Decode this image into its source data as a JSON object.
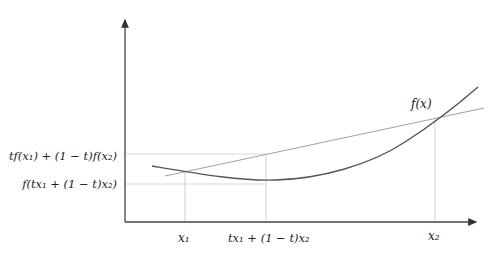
{
  "diagram": {
    "colors": {
      "axis": "#444444",
      "curve": "#555555",
      "chord": "#999999",
      "guide": "#cfcfcf",
      "text": "#222222"
    },
    "labels": {
      "fx": "f(x)",
      "x1": "x₁",
      "x2": "x₂",
      "mid_x": "tx₁ + (1 − t)x₂",
      "chord_value": "tf(x₁) + (1 − t)f(x₂)",
      "func_value": "f(tx₁ + (1 − t)x₂)"
    },
    "points": {
      "x1": {
        "x": 185,
        "y": 171
      },
      "mid_on_chord": {
        "x": 266,
        "y": 154
      },
      "mid_on_curve": {
        "x": 266,
        "y": 180
      },
      "x2": {
        "x": 435,
        "y": 119
      }
    }
  }
}
